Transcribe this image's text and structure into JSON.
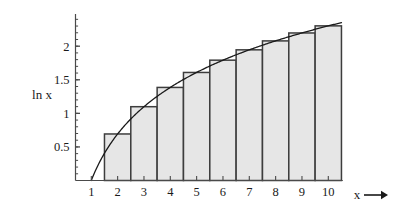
{
  "chart_data": {
    "type": "bar",
    "title": "",
    "subtitle": "",
    "xlabel": "x",
    "ylabel": "ln x",
    "xlim": [
      0.4,
      10.9
    ],
    "ylim": [
      0,
      2.42
    ],
    "grid": false,
    "legend": "none",
    "bar_alignment": "midpoint-rule-rectangles-centered-on-integers",
    "bar_width": 1,
    "categories": [
      "2",
      "3",
      "4",
      "5",
      "6",
      "7",
      "8",
      "9",
      "10"
    ],
    "x": [
      2,
      3,
      4,
      5,
      6,
      7,
      8,
      9,
      10
    ],
    "values": [
      0.693,
      1.099,
      1.386,
      1.609,
      1.792,
      1.946,
      2.079,
      2.197,
      2.303
    ],
    "series": [
      {
        "name": "ln x rectangles",
        "type": "bar",
        "values": [
          0.693,
          1.099,
          1.386,
          1.609,
          1.792,
          1.946,
          2.079,
          2.197,
          2.303
        ]
      },
      {
        "name": "ln x curve",
        "type": "line",
        "x": [
          1,
          1.25,
          1.5,
          1.75,
          2,
          2.5,
          3,
          3.5,
          4,
          4.5,
          5,
          5.5,
          6,
          6.5,
          7,
          7.5,
          8,
          8.5,
          9,
          9.5,
          10,
          10.5
        ],
        "values": [
          0,
          0.223,
          0.405,
          0.56,
          0.693,
          0.916,
          1.099,
          1.253,
          1.386,
          1.504,
          1.609,
          1.705,
          1.792,
          1.872,
          1.946,
          2.015,
          2.079,
          2.14,
          2.197,
          2.251,
          2.303,
          2.351
        ]
      }
    ],
    "x_ticks": [
      1,
      2,
      3,
      4,
      5,
      6,
      7,
      8,
      9,
      10
    ],
    "x_tick_labels": [
      "1",
      "2",
      "3",
      "4",
      "5",
      "6",
      "7",
      "8",
      "9",
      "10"
    ],
    "y_ticks": [
      0.5,
      1,
      1.5,
      2
    ],
    "y_tick_labels": [
      "0.5",
      "1",
      "1.5",
      "2"
    ],
    "y_minor_tick_step": 0.1,
    "x_axis_arrow": true,
    "colors": {
      "bar_fill": "#e6e6e6",
      "bar_stroke": "#3d3d3d",
      "curve_stroke": "#1a1a1a",
      "axis": "#4a4a4a",
      "text": "#1a1a1a",
      "background": "#ffffff"
    }
  },
  "labels": {
    "y_axis": "ln x",
    "x_axis": "x"
  }
}
